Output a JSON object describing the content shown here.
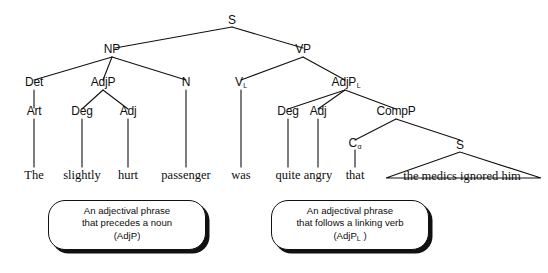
{
  "diagram": {
    "sentence": "The slightly hurt passenger was quite angry that the medics ignored him",
    "line_color": "#111111",
    "background": "#ffffff"
  },
  "nodes": {
    "s_root": "S",
    "np": "NP",
    "vp": "VP",
    "det": "Det",
    "adjp_np": "AdjP",
    "n": "N",
    "art": "Art",
    "deg_np": "Deg",
    "adj_np": "Adj",
    "v": "V",
    "v_sub": "L",
    "adjp_vp": "AdjP",
    "adjp_vp_sub": "L",
    "deg_vp": "Deg",
    "adj_vp": "Adj",
    "compp": "CompP",
    "c": "C",
    "c_sub": "α",
    "s_embedded": "S"
  },
  "words": {
    "the": "The",
    "slightly": "slightly",
    "hurt": "hurt",
    "passenger": "passenger",
    "was": "was",
    "quite": "quite",
    "angry": "angry",
    "that": "that",
    "embedded_clause": "the medics ignored him"
  },
  "callouts": {
    "left": {
      "line1": "An adjectival phrase",
      "line2": "that precedes a noun",
      "line3": "(AdjP)"
    },
    "right": {
      "line1": "An adjectival phrase",
      "line2": "that follows a linking verb",
      "line3_pre": "(AdjP",
      "line3_sub": "L",
      "line3_post": " )"
    }
  }
}
